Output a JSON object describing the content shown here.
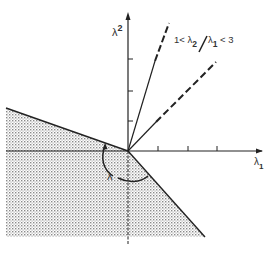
{
  "diagram": {
    "y_axis_label": "λ",
    "y_axis_sup": "2",
    "x_axis_label": "λ",
    "x_axis_sub": "1",
    "region_label": "λ",
    "annotation": {
      "prefix": "1< λ",
      "sub1": "2",
      "slash": "/",
      "lambda": "λ",
      "sub2": "1",
      "suffix": " < 3"
    },
    "colors": {
      "line": "#222222",
      "shade": "#9a9a9a",
      "background": "#ffffff"
    }
  }
}
